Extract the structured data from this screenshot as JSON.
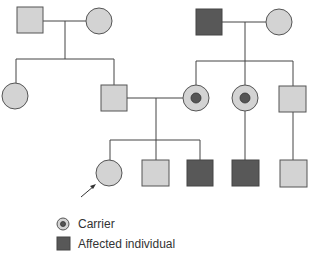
{
  "diagram": {
    "type": "pedigree",
    "colors": {
      "unaffected": "#d3d3d3",
      "affected": "#585858",
      "carrier_dot": "#555555"
    },
    "generations": [
      {
        "label": "I",
        "individuals": [
          {
            "id": "I-1",
            "sex": "male",
            "status": "unaffected"
          },
          {
            "id": "I-2",
            "sex": "female",
            "status": "unaffected"
          },
          {
            "id": "I-3",
            "sex": "male",
            "status": "affected"
          },
          {
            "id": "I-4",
            "sex": "female",
            "status": "unaffected"
          }
        ]
      },
      {
        "label": "II",
        "individuals": [
          {
            "id": "II-1",
            "sex": "female",
            "status": "unaffected",
            "parents": [
              "I-1",
              "I-2"
            ]
          },
          {
            "id": "II-2",
            "sex": "male",
            "status": "unaffected",
            "parents": [
              "I-1",
              "I-2"
            ]
          },
          {
            "id": "II-3",
            "sex": "female",
            "status": "carrier",
            "parents": [
              "I-3",
              "I-4"
            ]
          },
          {
            "id": "II-4",
            "sex": "female",
            "status": "carrier",
            "parents": [
              "I-3",
              "I-4"
            ]
          },
          {
            "id": "II-5",
            "sex": "male",
            "status": "unaffected",
            "parents": [
              "I-3",
              "I-4"
            ]
          }
        ]
      },
      {
        "label": "III",
        "individuals": [
          {
            "id": "III-1",
            "sex": "female",
            "status": "unaffected",
            "parents": [
              "II-2",
              "II-3"
            ],
            "proband": true
          },
          {
            "id": "III-2",
            "sex": "male",
            "status": "unaffected",
            "parents": [
              "II-2",
              "II-3"
            ]
          },
          {
            "id": "III-3",
            "sex": "male",
            "status": "affected",
            "parents": [
              "II-2",
              "II-3"
            ]
          },
          {
            "id": "III-4",
            "sex": "male",
            "status": "affected",
            "parents": [
              "II-4"
            ]
          },
          {
            "id": "III-5",
            "sex": "male",
            "status": "unaffected",
            "parents": [
              "II-5"
            ]
          }
        ]
      }
    ],
    "legend": [
      {
        "symbol": "carrier",
        "label": "Carrier"
      },
      {
        "symbol": "affected",
        "label": "Affected individual"
      }
    ]
  }
}
